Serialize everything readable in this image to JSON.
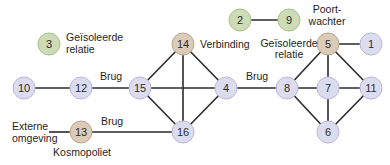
{
  "colors": {
    "lavender": "#dcdcef",
    "lavender_stroke": "#b8b8d8",
    "tan": "#dccbb6",
    "tan_stroke": "#bca58c",
    "green": "#cddcb5",
    "green_stroke": "#a9bd8c",
    "edge": "#2a2a2a",
    "text": "#1e1e1e"
  },
  "nodes": [
    {
      "id": "3",
      "x": 49,
      "y": 44,
      "type": "green"
    },
    {
      "id": "14",
      "x": 183,
      "y": 44,
      "type": "tan"
    },
    {
      "id": "2",
      "x": 240,
      "y": 20,
      "type": "green"
    },
    {
      "id": "9",
      "x": 289,
      "y": 20,
      "type": "green"
    },
    {
      "id": "5",
      "x": 328,
      "y": 44,
      "type": "tan"
    },
    {
      "id": "1",
      "x": 371,
      "y": 44,
      "type": "lavender"
    },
    {
      "id": "10",
      "x": 24,
      "y": 88,
      "type": "lavender"
    },
    {
      "id": "12",
      "x": 81,
      "y": 88,
      "type": "lavender"
    },
    {
      "id": "15",
      "x": 140,
      "y": 88,
      "type": "lavender"
    },
    {
      "id": "4",
      "x": 226,
      "y": 88,
      "type": "lavender"
    },
    {
      "id": "8",
      "x": 287,
      "y": 88,
      "type": "lavender"
    },
    {
      "id": "7",
      "x": 328,
      "y": 88,
      "type": "lavender"
    },
    {
      "id": "11",
      "x": 371,
      "y": 88,
      "type": "lavender"
    },
    {
      "id": "13",
      "x": 81,
      "y": 132,
      "type": "tan"
    },
    {
      "id": "16",
      "x": 183,
      "y": 132,
      "type": "lavender"
    },
    {
      "id": "6",
      "x": 328,
      "y": 132,
      "type": "lavender"
    }
  ],
  "edges": [
    [
      "2",
      "9"
    ],
    [
      "5",
      "1"
    ],
    [
      "10",
      "12"
    ],
    [
      "12",
      "15"
    ],
    [
      "15",
      "14"
    ],
    [
      "14",
      "4"
    ],
    [
      "14",
      "16"
    ],
    [
      "15",
      "4"
    ],
    [
      "15",
      "16"
    ],
    [
      "4",
      "16"
    ],
    [
      "4",
      "8"
    ],
    [
      "5",
      "8"
    ],
    [
      "5",
      "7"
    ],
    [
      "5",
      "11"
    ],
    [
      "8",
      "7"
    ],
    [
      "7",
      "11"
    ],
    [
      "8",
      "6"
    ],
    [
      "7",
      "6"
    ],
    [
      "11",
      "6"
    ],
    [
      "13",
      "16"
    ]
  ],
  "annotations": {
    "isolated_left_line1": "Geïsoleerde",
    "isolated_left_line2": "relatie",
    "verbinding": "Verbinding",
    "isolated_right_line1": "Geïsoleerde",
    "isolated_right_line2": "relatie",
    "poortwachter_line1": "Poort-",
    "poortwachter_line2": "wachter",
    "brug_left": "Brug",
    "brug_middle": "Brug",
    "brug_bottom": "Brug",
    "externe_line1": "Externe",
    "externe_line2": "omgeving",
    "kosmopoliet": "Kosmopoliet"
  }
}
